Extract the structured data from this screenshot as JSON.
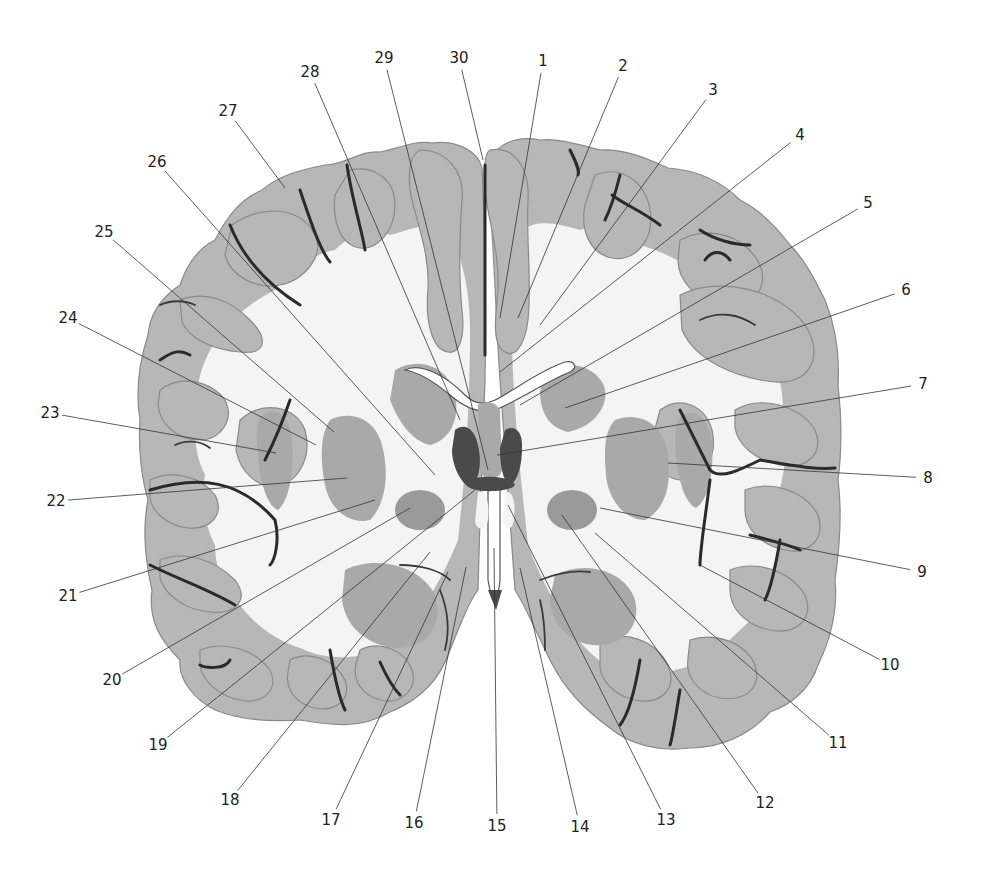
{
  "figure": {
    "type": "coronal brain section, histological stain",
    "background_color": "#ffffff",
    "tissue_gray_color": "#b7b7b7",
    "white_matter_color": "#f4f4f4",
    "sulcus_color": "#2a2a2a"
  },
  "labels": [
    {
      "num": "1",
      "x": 543,
      "y": 61,
      "tx": 500,
      "ty": 318
    },
    {
      "num": "2",
      "x": 623,
      "y": 66,
      "tx": 518,
      "ty": 318
    },
    {
      "num": "3",
      "x": 713,
      "y": 90,
      "tx": 540,
      "ty": 325
    },
    {
      "num": "4",
      "x": 800,
      "y": 135,
      "tx": 500,
      "ty": 372
    },
    {
      "num": "5",
      "x": 868,
      "y": 203,
      "tx": 520,
      "ty": 405
    },
    {
      "num": "6",
      "x": 906,
      "y": 290,
      "tx": 565,
      "ty": 408
    },
    {
      "num": "7",
      "x": 923,
      "y": 384,
      "tx": 497,
      "ty": 455
    },
    {
      "num": "8",
      "x": 928,
      "y": 478,
      "tx": 668,
      "ty": 463
    },
    {
      "num": "9",
      "x": 922,
      "y": 572,
      "tx": 600,
      "ty": 508
    },
    {
      "num": "10",
      "x": 890,
      "y": 665,
      "tx": 700,
      "ty": 565
    },
    {
      "num": "11",
      "x": 838,
      "y": 743,
      "tx": 595,
      "ty": 533
    },
    {
      "num": "12",
      "x": 765,
      "y": 803,
      "tx": 562,
      "ty": 515
    },
    {
      "num": "13",
      "x": 666,
      "y": 820,
      "tx": 508,
      "ty": 505
    },
    {
      "num": "14",
      "x": 580,
      "y": 827,
      "tx": 520,
      "ty": 568
    },
    {
      "num": "15",
      "x": 497,
      "y": 826,
      "tx": 494,
      "ty": 548
    },
    {
      "num": "16",
      "x": 414,
      "y": 823,
      "tx": 466,
      "ty": 567
    },
    {
      "num": "17",
      "x": 331,
      "y": 820,
      "tx": 448,
      "ty": 572
    },
    {
      "num": "18",
      "x": 230,
      "y": 800,
      "tx": 430,
      "ty": 552
    },
    {
      "num": "19",
      "x": 158,
      "y": 745,
      "tx": 475,
      "ty": 490
    },
    {
      "num": "20",
      "x": 112,
      "y": 680,
      "tx": 410,
      "ty": 508
    },
    {
      "num": "21",
      "x": 68,
      "y": 596,
      "tx": 375,
      "ty": 500
    },
    {
      "num": "22",
      "x": 56,
      "y": 501,
      "tx": 347,
      "ty": 478
    },
    {
      "num": "23",
      "x": 50,
      "y": 413,
      "tx": 276,
      "ty": 453
    },
    {
      "num": "24",
      "x": 68,
      "y": 318,
      "tx": 316,
      "ty": 445
    },
    {
      "num": "25",
      "x": 104,
      "y": 232,
      "tx": 334,
      "ty": 432
    },
    {
      "num": "26",
      "x": 157,
      "y": 162,
      "tx": 435,
      "ty": 475
    },
    {
      "num": "27",
      "x": 228,
      "y": 111,
      "tx": 285,
      "ty": 188
    },
    {
      "num": "28",
      "x": 310,
      "y": 72,
      "tx": 460,
      "ty": 420
    },
    {
      "num": "29",
      "x": 384,
      "y": 58,
      "tx": 488,
      "ty": 470
    },
    {
      "num": "30",
      "x": 459,
      "y": 58,
      "tx": 483,
      "ty": 160
    }
  ]
}
